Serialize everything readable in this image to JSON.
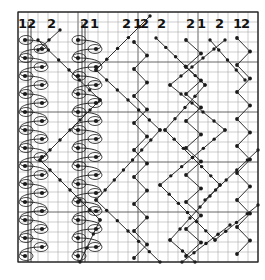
{
  "diagram": {
    "type": "knitting/braid chart",
    "grid": {
      "x0": 18,
      "y0": 12,
      "x1": 258,
      "y1": 262,
      "cols": 24,
      "rows": 25,
      "line_color": "#9a9a9a",
      "major_line_color": "#555555",
      "border_color": "#222222"
    },
    "column_labels": [
      {
        "text": "1",
        "x": 18
      },
      {
        "text": "2",
        "x": 27
      },
      {
        "text": "2",
        "x": 47
      },
      {
        "text": "2",
        "x": 80
      },
      {
        "text": "1",
        "x": 90
      },
      {
        "text": "2",
        "x": 122
      },
      {
        "text": "1",
        "x": 133
      },
      {
        "text": "2",
        "x": 140
      },
      {
        "text": "2",
        "x": 157
      },
      {
        "text": "2",
        "x": 186
      },
      {
        "text": "1",
        "x": 197
      },
      {
        "text": "2",
        "x": 215
      },
      {
        "text": "1",
        "x": 233
      },
      {
        "text": "2",
        "x": 241
      }
    ],
    "ink_color": "#1a1a1a",
    "zigzag_columns": [
      {
        "x_left": 134,
        "x_right": 147,
        "y_start": 42,
        "y_end": 262,
        "step": 13.5
      },
      {
        "x_left": 186,
        "x_right": 201,
        "y_start": 40,
        "y_end": 262,
        "step": 13.5
      },
      {
        "x_left": 237,
        "x_right": 250,
        "y_start": 38,
        "y_end": 262,
        "step": 13.5
      }
    ],
    "loop_columns": [
      {
        "x_left": 25,
        "x_right": 42,
        "y_start": 40,
        "y_end": 258,
        "step": 18
      },
      {
        "x_left": 78,
        "x_right": 96,
        "y_start": 40,
        "y_end": 258,
        "step": 18
      }
    ],
    "diagonals": [
      [
        [
          38,
          40
        ],
        [
          100,
          100
        ],
        [
          40,
          160
        ],
        [
          100,
          220
        ],
        [
          80,
          262
        ]
      ],
      [
        [
          60,
          30
        ],
        [
          38,
          50
        ]
      ],
      [
        [
          96,
          70
        ],
        [
          150,
          16
        ]
      ],
      [
        [
          96,
          70
        ],
        [
          160,
          130
        ],
        [
          96,
          200
        ],
        [
          160,
          262
        ]
      ],
      [
        [
          156,
          38
        ],
        [
          205,
          85
        ],
        [
          165,
          130
        ],
        [
          220,
          185
        ],
        [
          170,
          240
        ],
        [
          195,
          262
        ]
      ],
      [
        [
          225,
          40
        ],
        [
          170,
          85
        ],
        [
          225,
          130
        ],
        [
          160,
          185
        ],
        [
          215,
          240
        ]
      ],
      [
        [
          210,
          40
        ],
        [
          245,
          80
        ]
      ],
      [
        [
          205,
          200
        ],
        [
          258,
          150
        ]
      ],
      [
        [
          215,
          240
        ],
        [
          258,
          205
        ]
      ],
      [
        [
          182,
          262
        ],
        [
          230,
          225
        ]
      ]
    ]
  }
}
